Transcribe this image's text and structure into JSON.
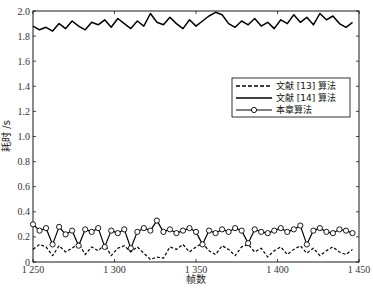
{
  "chart_data": {
    "type": "line",
    "title": "",
    "xlabel": "帧数",
    "ylabel": "耗时 /s",
    "xlim": [
      1250,
      1450
    ],
    "ylim": [
      0,
      2.0
    ],
    "xticks": [
      1250,
      1300,
      1350,
      1400,
      1450
    ],
    "xtick_labels": [
      "1 250",
      "1 300",
      "1 350",
      "1 400",
      "1 450"
    ],
    "yticks": [
      0,
      0.2,
      0.4,
      0.6,
      0.8,
      1.0,
      1.2,
      1.4,
      1.6,
      1.8,
      2.0
    ],
    "ytick_labels": [
      "0",
      "0.2",
      "0.4",
      "0.6",
      "0.8",
      "1.0",
      "1.2",
      "1.4",
      "1.6",
      "1.8",
      "2.0"
    ],
    "grid": false,
    "legend_position": "center-right",
    "x": [
      1250,
      1254,
      1258,
      1262,
      1266,
      1270,
      1274,
      1278,
      1282,
      1286,
      1290,
      1294,
      1298,
      1302,
      1306,
      1310,
      1314,
      1318,
      1322,
      1326,
      1330,
      1334,
      1338,
      1342,
      1346,
      1350,
      1354,
      1358,
      1362,
      1366,
      1370,
      1374,
      1378,
      1382,
      1386,
      1390,
      1394,
      1398,
      1402,
      1406,
      1410,
      1414,
      1418,
      1422,
      1426,
      1430,
      1434,
      1438,
      1442,
      1446
    ],
    "series": [
      {
        "name": "文献 [13] 算法",
        "style": "dashed",
        "color": "#000000",
        "values": [
          0.1,
          0.14,
          0.12,
          0.05,
          0.13,
          0.08,
          0.11,
          0.15,
          0.06,
          0.12,
          0.09,
          0.14,
          0.05,
          0.11,
          0.13,
          0.08,
          0.12,
          0.07,
          0.02,
          0.04,
          0.03,
          0.12,
          0.1,
          0.14,
          0.08,
          0.12,
          0.15,
          0.09,
          0.06,
          0.13,
          0.1,
          0.05,
          0.12,
          0.14,
          0.08,
          0.11,
          0.04,
          0.09,
          0.12,
          0.06,
          0.1,
          0.13,
          0.07,
          0.11,
          0.05,
          0.09,
          0.12,
          0.08,
          0.06,
          0.1
        ]
      },
      {
        "name": "文献 [14] 算法",
        "style": "solid",
        "color": "#000000",
        "values": [
          1.88,
          1.85,
          1.87,
          1.84,
          1.9,
          1.86,
          1.92,
          1.88,
          1.85,
          1.91,
          1.89,
          1.93,
          1.87,
          1.94,
          1.9,
          1.86,
          1.92,
          1.88,
          1.98,
          1.91,
          1.89,
          1.95,
          1.9,
          1.86,
          1.93,
          1.88,
          1.92,
          1.96,
          1.99,
          1.97,
          1.9,
          1.87,
          1.92,
          1.89,
          1.94,
          1.88,
          1.91,
          1.86,
          1.93,
          1.9,
          1.97,
          1.91,
          1.95,
          1.89,
          1.98,
          1.93,
          1.96,
          1.9,
          1.87,
          1.91
        ]
      },
      {
        "name": "本章算法",
        "style": "solid-circle-marker",
        "color": "#000000",
        "values": [
          0.3,
          0.25,
          0.27,
          0.14,
          0.28,
          0.22,
          0.25,
          0.13,
          0.26,
          0.24,
          0.27,
          0.12,
          0.25,
          0.23,
          0.26,
          0.11,
          0.24,
          0.27,
          0.25,
          0.33,
          0.24,
          0.26,
          0.23,
          0.25,
          0.27,
          0.24,
          0.14,
          0.25,
          0.23,
          0.26,
          0.24,
          0.27,
          0.25,
          0.15,
          0.26,
          0.24,
          0.23,
          0.25,
          0.27,
          0.24,
          0.26,
          0.29,
          0.14,
          0.25,
          0.27,
          0.24,
          0.23,
          0.26,
          0.25,
          0.23
        ]
      }
    ]
  }
}
